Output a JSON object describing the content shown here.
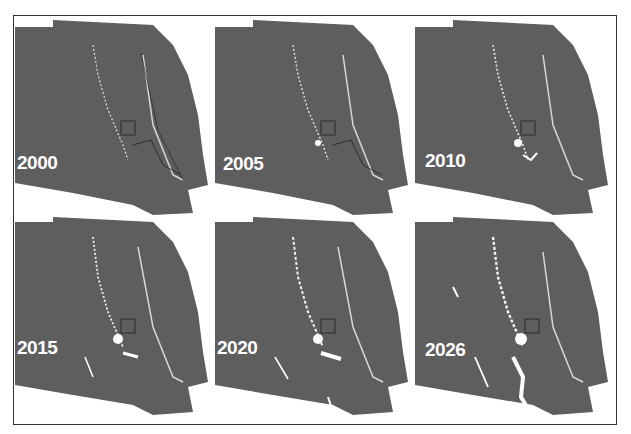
{
  "figure": {
    "type": "land-cover-change-map-series",
    "colors": {
      "map_fill": "#5e5e5e",
      "cleared_area": "#ffffff",
      "boundary_line": "#1e1e1e",
      "background": "#ffffff",
      "frame": "#333333"
    },
    "panels": [
      {
        "year": "2000"
      },
      {
        "year": "2005"
      },
      {
        "year": "2010"
      },
      {
        "year": "2015"
      },
      {
        "year": "2020"
      },
      {
        "year": "2026"
      }
    ]
  }
}
